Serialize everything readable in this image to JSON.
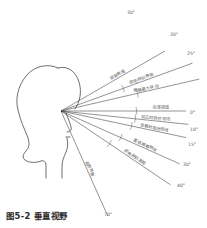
{
  "figure": {
    "caption": "图5-2 垂直视野",
    "eye_point": {
      "x": 61,
      "y": 111
    },
    "head": {
      "label": "侧面人头轮廓",
      "facing": "right"
    }
  },
  "rays": [
    {
      "id": "ray-up-30",
      "label": "视野界限",
      "angle_text": "30°",
      "angle_deg": 30,
      "direction": "up",
      "length": 120,
      "label_pos_t": 0.56,
      "angle_label": {
        "x": 127,
        "y": 14
      },
      "tick_t": 0.0
    },
    {
      "id": "ray-up-20",
      "label": "颜色辨别界限",
      "angle_text": "30°",
      "angle_deg": 20,
      "direction": "up",
      "length": 140,
      "label_pos_t": 0.62,
      "angle_label": {
        "x": 170,
        "y": 36
      },
      "tick_t": 0.47
    },
    {
      "id": "ray-up-13",
      "label": "眼睛最大转动",
      "angle_text": "25°",
      "angle_deg": 13,
      "direction": "up",
      "length": 142,
      "label_pos_t": 0.62,
      "angle_label": {
        "x": 187,
        "y": 55
      },
      "tick_t": 0.55
    },
    {
      "id": "ray-standard",
      "label": "标准视线",
      "angle_text": "0°",
      "angle_deg": 0,
      "direction": "up",
      "length": 125,
      "label_pos_t": 0.8,
      "angle_label": {
        "x": 190,
        "y": 114
      },
      "tick_t": 0.6
    },
    {
      "id": "ray-down-10",
      "label": "站立时自然视线",
      "angle_text": "10°",
      "angle_deg": 6,
      "direction": "down",
      "length": 128,
      "label_pos_t": 0.74,
      "angle_label": {
        "x": 190,
        "y": 131
      },
      "tick_t": 0.58
    },
    {
      "id": "ray-down-15",
      "label": "坐着时自然视线",
      "angle_text": "15°",
      "angle_deg": 12,
      "direction": "down",
      "length": 128,
      "label_pos_t": 0.74,
      "angle_label": {
        "x": 188,
        "y": 146
      },
      "tick_t": 0.56
    },
    {
      "id": "ray-down-30",
      "label": "最佳眼睛转动",
      "angle_text": "30°",
      "angle_deg": 24,
      "direction": "down",
      "length": 130,
      "label_pos_t": 0.7,
      "angle_label": {
        "x": 183,
        "y": 166
      },
      "tick_t": 0.5
    },
    {
      "id": "ray-down-40",
      "label": "颜色辨别界限",
      "angle_text": "40°",
      "angle_deg": 34,
      "direction": "down",
      "length": 132,
      "label_pos_t": 0.66,
      "angle_label": {
        "x": 177,
        "y": 187
      },
      "tick_t": 0.44
    },
    {
      "id": "ray-down-70",
      "label": "视野界限",
      "angle_text": "70°",
      "angle_deg": 66,
      "direction": "down",
      "length": 115,
      "label_pos_t": 0.56,
      "angle_label": {
        "x": 104,
        "y": 216
      },
      "tick_t": 0.0
    }
  ]
}
